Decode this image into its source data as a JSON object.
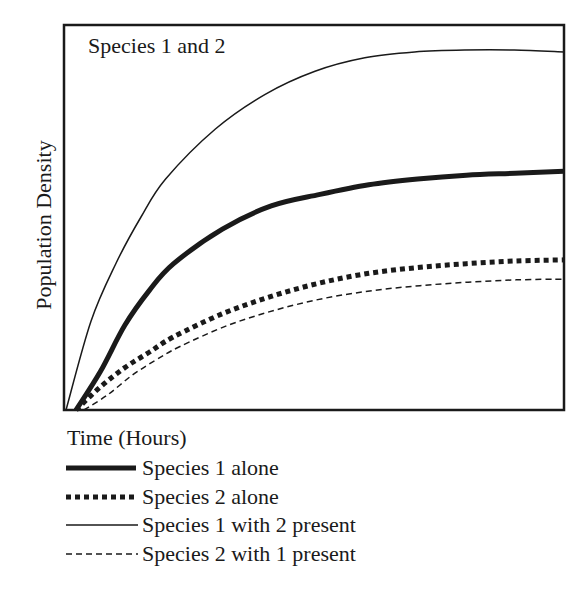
{
  "chart_data": {
    "type": "line",
    "title": "Species 1 and 2",
    "xlabel": "Time (Hours)",
    "ylabel": "Population Density",
    "xlim": [
      0,
      100
    ],
    "ylim": [
      0,
      100
    ],
    "grid": false,
    "ticks": false,
    "legend_position": "below",
    "x": [
      0,
      5,
      10,
      15,
      20,
      30,
      40,
      50,
      60,
      70,
      80,
      90,
      100
    ],
    "series": [
      {
        "name": "Species 1 alone",
        "style": "thick-solid",
        "values": [
          0,
          10,
          22,
          31,
          38,
          47,
          53,
          56,
          58.5,
          60,
          61,
          61.5,
          62
        ]
      },
      {
        "name": "Species 2 alone",
        "style": "thick-dotted",
        "values": [
          0,
          6,
          11,
          15,
          19,
          25,
          29.5,
          33,
          35.5,
          37,
          38,
          38.7,
          39
        ]
      },
      {
        "name": "Species 1 with 2 present",
        "style": "thin-solid",
        "values": [
          0,
          23,
          38,
          50,
          60,
          73,
          82,
          88,
          91.5,
          93,
          93.5,
          93.5,
          93
        ]
      },
      {
        "name": "Species 2 with 1 present",
        "style": "thin-dashed",
        "values": [
          0,
          4,
          9,
          13,
          16.5,
          22,
          26,
          29,
          31,
          32.3,
          33.2,
          33.8,
          34
        ]
      }
    ]
  },
  "legend": {
    "items": [
      {
        "label": "Species 1 alone",
        "style": "thick-solid"
      },
      {
        "label": "Species 2 alone",
        "style": "thick-dotted"
      },
      {
        "label": "Species 1 with 2 present",
        "style": "thin-solid"
      },
      {
        "label": "Species 2 with 1 present",
        "style": "thin-dashed"
      }
    ]
  },
  "colors": {
    "ink": "#1a1a1a",
    "background": "#ffffff"
  }
}
